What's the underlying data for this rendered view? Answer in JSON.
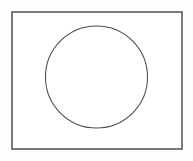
{
  "canvas": {
    "width": 193,
    "height": 161,
    "background_color": "#fdfdfd"
  },
  "chart_data": {
    "type": "diagram",
    "shapes": [
      {
        "name": "rectangle",
        "x": 12,
        "y": 12,
        "width": 170,
        "height": 137,
        "stroke": "#5a5a5a",
        "stroke_width": 1.6,
        "fill": "#ffffff"
      },
      {
        "name": "circle",
        "cx": 96.5,
        "cy": 77,
        "r": 51,
        "stroke": "#4a4a4a",
        "stroke_width": 1.05,
        "fill": "none"
      }
    ]
  },
  "shapes": {
    "rectangle": {
      "x": "12",
      "y": "12",
      "width": "170",
      "height": "137",
      "stroke": "#5a5a5a",
      "stroke_width": "1.6",
      "fill": "#ffffff"
    },
    "circle": {
      "cx": "96.5",
      "cy": "77",
      "r": "51",
      "stroke": "#4a4a4a",
      "stroke_width": "1.05",
      "fill": "none"
    }
  }
}
